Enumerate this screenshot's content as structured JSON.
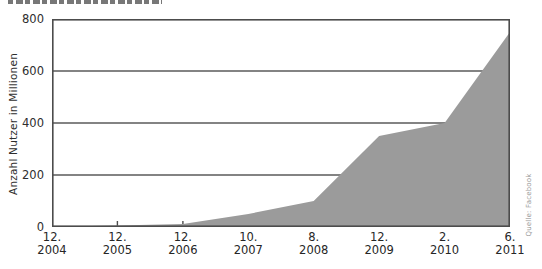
{
  "colors": {
    "area_fill": "#9b9b9b",
    "axis_frame": "#4c4c4c",
    "gridline": "#5a5a5a",
    "tick_mark": "#4c4c4c",
    "label_text": "#2e2e2e",
    "source_text": "#9a9a9a",
    "background": "#ffffff"
  },
  "chart_data": {
    "type": "area",
    "categories": [
      "12. 2004",
      "12. 2005",
      "12. 2006",
      "10. 2007",
      "8. 2008",
      "12. 2009",
      "2. 2010",
      "6. 2011"
    ],
    "x_tick_labels": [
      {
        "month": "12.",
        "year": "2004"
      },
      {
        "month": "12.",
        "year": "2005"
      },
      {
        "month": "12.",
        "year": "2006"
      },
      {
        "month": "10.",
        "year": "2007"
      },
      {
        "month": "8.",
        "year": "2008"
      },
      {
        "month": "12.",
        "year": "2009"
      },
      {
        "month": "2.",
        "year": "2010"
      },
      {
        "month": "6.",
        "year": "2011"
      }
    ],
    "values": [
      1,
      5.5,
      12,
      50,
      100,
      350,
      400,
      750
    ],
    "title": "",
    "xlabel": "",
    "ylabel": "Anzahl Nutzer in Millionen",
    "ylim": [
      0,
      800
    ],
    "yticks": [
      0,
      200,
      400,
      600,
      800
    ],
    "grid": "horizontal",
    "legend": "none",
    "source": "Quelle: Facebook"
  }
}
